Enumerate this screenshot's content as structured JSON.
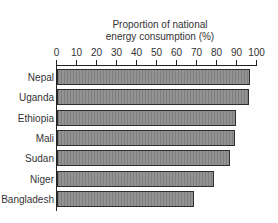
{
  "chart_data": {
    "type": "bar",
    "orientation": "horizontal",
    "title": "Proportion of national energy consumption (%)",
    "title_lines": [
      "Proportion of national",
      "energy consumption (%)"
    ],
    "xlabel": "Proportion of national energy consumption (%)",
    "ylabel": "",
    "categories": [
      "Nepal",
      "Uganda",
      "Ethiopia",
      "Mali",
      "Sudan",
      "Niger",
      "Bangladesh"
    ],
    "values": [
      97,
      96.5,
      90,
      89.5,
      87,
      79,
      69
    ],
    "xlim": [
      0,
      100
    ],
    "x_ticks": [
      "0",
      "10",
      "20",
      "30",
      "40",
      "50",
      "60",
      "70",
      "80",
      "90",
      "100"
    ],
    "axis_position": "top",
    "grid": false,
    "legend": null,
    "bar_color": "#8c8c8c",
    "bar_border_color": "#2e2e2e"
  }
}
